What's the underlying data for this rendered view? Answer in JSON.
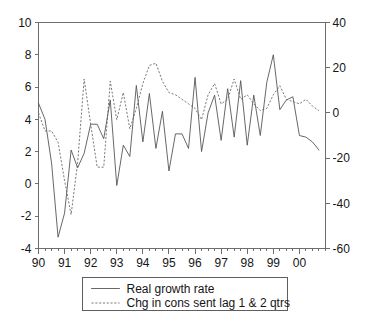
{
  "chart_data": {
    "type": "line",
    "title": "",
    "xlabel": "",
    "ylabel": "",
    "y2label": "",
    "grid": false,
    "legend_position": "bottom-center",
    "x_axis": {
      "tick_labels": [
        "90",
        "91",
        "92",
        "93",
        "94",
        "95",
        "96",
        "97",
        "98",
        "99",
        "00"
      ],
      "tick_values": [
        1990,
        1991,
        1992,
        1993,
        1994,
        1995,
        1996,
        1997,
        1998,
        1999,
        2000
      ],
      "minor_ticks_per_interval": 4,
      "xlim": [
        1990,
        2001.0
      ]
    },
    "y_axis_left": {
      "tick_labels": [
        "10",
        "8",
        "6",
        "4",
        "2",
        "0",
        "-2",
        "-4"
      ],
      "tick_values": [
        10,
        8,
        6,
        4,
        2,
        0,
        -2,
        -4
      ],
      "ylim": [
        -4,
        10
      ]
    },
    "y_axis_right": {
      "tick_labels": [
        "40",
        "20",
        "0",
        "-20",
        "-40",
        "-60"
      ],
      "tick_values": [
        40,
        20,
        0,
        -20,
        -40,
        -60
      ],
      "ylim": [
        -60,
        40
      ]
    },
    "x": [
      1990.0,
      1990.25,
      1990.5,
      1990.75,
      1991.0,
      1991.25,
      1991.5,
      1991.75,
      1992.0,
      1992.25,
      1992.5,
      1992.75,
      1993.0,
      1993.25,
      1993.5,
      1993.75,
      1994.0,
      1994.25,
      1994.5,
      1994.75,
      1995.0,
      1995.25,
      1995.5,
      1995.75,
      1996.0,
      1996.25,
      1996.5,
      1996.75,
      1997.0,
      1997.25,
      1997.5,
      1997.75,
      1998.0,
      1998.25,
      1998.5,
      1998.75,
      1999.0,
      1999.25,
      1999.5,
      1999.75,
      2000.0,
      2000.25,
      2000.5,
      2000.75
    ],
    "series": [
      {
        "name": "Real growth rate",
        "axis": "left",
        "style": "solid",
        "color": "#575757",
        "values": [
          5.0,
          4.0,
          1.3,
          -3.3,
          -1.8,
          2.1,
          1.0,
          1.9,
          3.7,
          3.7,
          2.8,
          5.2,
          -0.1,
          2.4,
          1.7,
          6.1,
          2.6,
          5.6,
          2.2,
          4.5,
          0.8,
          3.1,
          3.1,
          2.2,
          6.6,
          2.0,
          4.4,
          5.5,
          2.7,
          5.9,
          2.9,
          6.4,
          2.4,
          5.5,
          3.0,
          6.3,
          8.0,
          4.6,
          5.2,
          5.4,
          3.0,
          2.9,
          2.6,
          2.1
        ]
      },
      {
        "name": "Chg in cons sent lag 1 & 2 qtrs",
        "axis": "right",
        "style": "dotted",
        "color": "#6a6a6a",
        "values": [
          0.0,
          -8.0,
          -8.0,
          -13.0,
          -30.0,
          -45.0,
          -22.0,
          15.0,
          -5.0,
          -24.0,
          -24.0,
          14.0,
          -3.0,
          9.0,
          -7.0,
          2.0,
          13.0,
          21.0,
          22.0,
          14.0,
          9.0,
          8.0,
          6.0,
          4.0,
          2.0,
          -3.0,
          8.0,
          13.0,
          4.0,
          6.0,
          15.0,
          6.0,
          8.0,
          4.0,
          1.0,
          2.0,
          8.0,
          12.0,
          6.0,
          5.0,
          4.0,
          6.0,
          3.0,
          1.0
        ]
      }
    ],
    "legend": [
      {
        "label": "Real growth rate",
        "style": "solid"
      },
      {
        "label": "Chg in cons sent lag 1 & 2 qtrs",
        "style": "dotted"
      }
    ]
  }
}
